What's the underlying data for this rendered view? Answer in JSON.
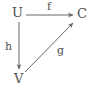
{
  "diagram": {
    "type": "commutative-diagram",
    "background_color": "#ffffff",
    "stroke_color": "#666666",
    "text_color": "#4d4d4d",
    "nodes": [
      {
        "id": "U",
        "label": "U",
        "x": 19,
        "y": 14
      },
      {
        "id": "C",
        "label": "C",
        "x": 82,
        "y": 14
      },
      {
        "id": "V",
        "label": "V",
        "x": 20,
        "y": 79
      }
    ],
    "edges": [
      {
        "id": "f",
        "label": "f",
        "from": "U",
        "to": "C",
        "orientation": "horizontal",
        "arrowhead": "end",
        "x1": 26,
        "y1": 15,
        "x2": 76,
        "y2": 15
      },
      {
        "id": "h",
        "label": "h",
        "from": "U",
        "to": "V",
        "orientation": "vertical",
        "arrowhead": "end",
        "x1": 19,
        "y1": 22,
        "x2": 19,
        "y2": 72
      },
      {
        "id": "g",
        "label": "g",
        "from": "V",
        "to": "C",
        "orientation": "diagonal",
        "arrowhead": "end",
        "x1": 25,
        "y1": 72,
        "x2": 75,
        "y2": 21
      }
    ]
  }
}
